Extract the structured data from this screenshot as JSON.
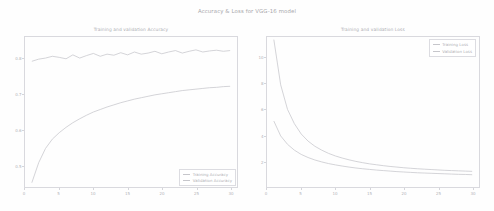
{
  "figure": {
    "suptitle": "Accuracy & Loss for VGG-16 model",
    "background": "#fefefe",
    "line_color": "#c9c9ce",
    "axis_color": "#d9d9de",
    "text_color": "#b0b0b5"
  },
  "chart_data": [
    {
      "type": "line",
      "title": "Training and validation Accuracy",
      "xlabel": "",
      "ylabel": "",
      "xlim": [
        0,
        31
      ],
      "ylim": [
        0.44,
        0.86
      ],
      "grid": false,
      "legend_position": "lower right",
      "xticks": [
        0,
        5,
        10,
        15,
        20,
        25,
        30
      ],
      "yticks": [
        0.5,
        0.6,
        0.7,
        0.8
      ],
      "ytick_labels": [
        "0.5",
        "0.6",
        "0.7",
        "0.8"
      ],
      "xtick_labels": [
        "0",
        "5",
        "10",
        "15",
        "20",
        "25",
        "30"
      ],
      "series": [
        {
          "name": "Training Accuracy",
          "x": [
            1,
            2,
            3,
            4,
            5,
            6,
            7,
            8,
            9,
            10,
            11,
            12,
            13,
            14,
            15,
            16,
            17,
            18,
            19,
            20,
            21,
            22,
            23,
            24,
            25,
            26,
            27,
            28,
            29,
            30
          ],
          "values": [
            0.452,
            0.508,
            0.548,
            0.574,
            0.592,
            0.607,
            0.62,
            0.631,
            0.641,
            0.65,
            0.657,
            0.664,
            0.67,
            0.676,
            0.681,
            0.686,
            0.69,
            0.694,
            0.698,
            0.701,
            0.704,
            0.707,
            0.71,
            0.712,
            0.714,
            0.716,
            0.718,
            0.719,
            0.721,
            0.722
          ]
        },
        {
          "name": "Validation Accuracy",
          "x": [
            1,
            2,
            3,
            4,
            5,
            6,
            7,
            8,
            9,
            10,
            11,
            12,
            13,
            14,
            15,
            16,
            17,
            18,
            19,
            20,
            21,
            22,
            23,
            24,
            25,
            26,
            27,
            28,
            29,
            30
          ],
          "values": [
            0.792,
            0.798,
            0.801,
            0.806,
            0.803,
            0.799,
            0.81,
            0.801,
            0.808,
            0.814,
            0.806,
            0.812,
            0.809,
            0.816,
            0.81,
            0.818,
            0.812,
            0.815,
            0.82,
            0.813,
            0.818,
            0.822,
            0.815,
            0.82,
            0.824,
            0.818,
            0.821,
            0.823,
            0.82,
            0.822
          ]
        }
      ]
    },
    {
      "type": "line",
      "title": "Training and validation Loss",
      "xlabel": "",
      "ylabel": "",
      "xlim": [
        0,
        31
      ],
      "ylim": [
        0.0,
        11.6
      ],
      "grid": false,
      "legend_position": "upper right",
      "xticks": [
        0,
        5,
        10,
        15,
        20,
        25,
        30
      ],
      "yticks": [
        2,
        4,
        6,
        8,
        10
      ],
      "ytick_labels": [
        "2",
        "4",
        "6",
        "8",
        "10"
      ],
      "xtick_labels": [
        "0",
        "5",
        "10",
        "15",
        "20",
        "25",
        "30"
      ],
      "series": [
        {
          "name": "Training Loss",
          "x": [
            1,
            2,
            3,
            4,
            5,
            6,
            7,
            8,
            9,
            10,
            11,
            12,
            13,
            14,
            15,
            16,
            17,
            18,
            19,
            20,
            21,
            22,
            23,
            24,
            25,
            26,
            27,
            28,
            29,
            30
          ],
          "values": [
            11.4,
            7.9,
            6.0,
            4.9,
            4.1,
            3.55,
            3.15,
            2.85,
            2.6,
            2.4,
            2.24,
            2.1,
            1.98,
            1.88,
            1.79,
            1.72,
            1.65,
            1.59,
            1.54,
            1.49,
            1.45,
            1.41,
            1.38,
            1.35,
            1.32,
            1.29,
            1.27,
            1.25,
            1.23,
            1.21
          ]
        },
        {
          "name": "Validation Loss",
          "x": [
            1,
            2,
            3,
            4,
            5,
            6,
            7,
            8,
            9,
            10,
            11,
            12,
            13,
            14,
            15,
            16,
            17,
            18,
            19,
            20,
            21,
            22,
            23,
            24,
            25,
            26,
            27,
            28,
            29,
            30
          ],
          "values": [
            5.1,
            3.95,
            3.3,
            2.85,
            2.52,
            2.28,
            2.09,
            1.94,
            1.81,
            1.71,
            1.62,
            1.54,
            1.47,
            1.41,
            1.36,
            1.31,
            1.27,
            1.23,
            1.19,
            1.16,
            1.13,
            1.1,
            1.08,
            1.06,
            1.04,
            1.02,
            1.0,
            0.98,
            0.97,
            0.95
          ]
        }
      ]
    }
  ]
}
